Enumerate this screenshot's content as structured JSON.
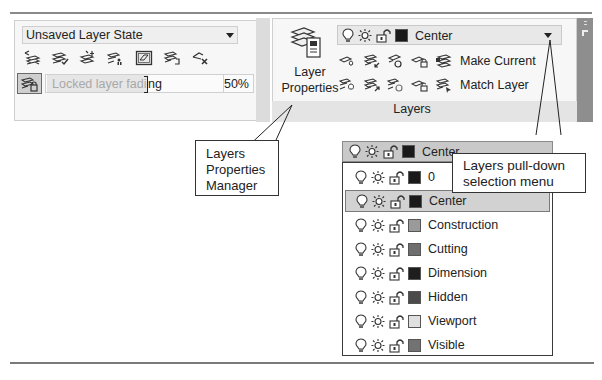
{
  "left_panel": {
    "layer_state": "Unsaved Layer State",
    "tool_icons": [
      "layer-previous-icon",
      "layer-isolate-icon",
      "layer-freeze-icon",
      "layer-walk-icon",
      "layer-off-icon",
      "layer-merge-icon",
      "layer-delete-icon"
    ],
    "lock_fade": {
      "tooltip": "Locked layer fadi",
      "value_tail": "ng",
      "percent": "50%"
    }
  },
  "ribbon": {
    "panel_title": "Layers",
    "layer_properties_label_line1": "Layer",
    "layer_properties_label_line2": "Properties",
    "current_layer": {
      "name": "Center",
      "color": "#1a1a1a"
    },
    "make_current_label": "Make Current",
    "match_layer_label": "Match Layer"
  },
  "dropdown": {
    "header": {
      "name": "Center",
      "color": "#1a1a1a"
    },
    "selected_index": 1,
    "layers": [
      {
        "name": "0",
        "color": "#1a1a1a"
      },
      {
        "name": "Center",
        "color": "#1a1a1a"
      },
      {
        "name": "Construction",
        "color": "#9a9a9a"
      },
      {
        "name": "Cutting",
        "color": "#6e6e6e"
      },
      {
        "name": "Dimension",
        "color": "#1e1e1e"
      },
      {
        "name": "Hidden",
        "color": "#4a4a4a"
      },
      {
        "name": "Viewport",
        "color": "#e0e0e0"
      },
      {
        "name": "Visible",
        "color": "#727272"
      }
    ]
  },
  "callouts": {
    "layers_properties_manager": [
      "Layers",
      "Properties",
      "Manager"
    ],
    "pulldown_menu": [
      "Layers pull-down",
      "selection menu"
    ]
  }
}
